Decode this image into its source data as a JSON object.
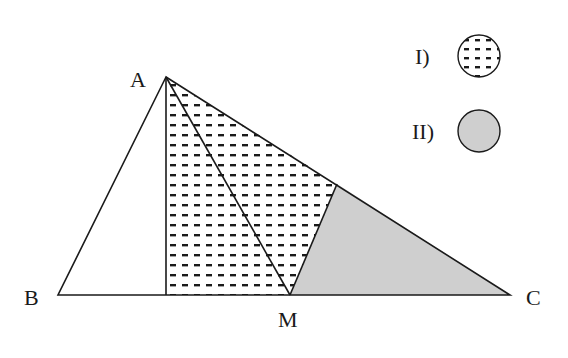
{
  "diagram": {
    "points": {
      "A": {
        "label": "A",
        "x": 166,
        "y": 77
      },
      "B": {
        "label": "B",
        "x": 58,
        "y": 295
      },
      "H": {
        "label": "",
        "x": 166,
        "y": 295
      },
      "M": {
        "label": "M",
        "x": 290,
        "y": 295
      },
      "C": {
        "label": "C",
        "x": 510,
        "y": 295
      },
      "N": {
        "label": "",
        "x": 337,
        "y": 184
      }
    },
    "regions": [
      {
        "id": "I",
        "fill": "dashed-pattern",
        "vertices": [
          "A",
          "H",
          "M",
          "N"
        ]
      },
      {
        "id": "II",
        "fill": "#cfcfcf",
        "vertices": [
          "N",
          "M",
          "C"
        ]
      }
    ],
    "legend": [
      {
        "label": "I)",
        "fill": "dashed-pattern"
      },
      {
        "label": "II)",
        "fill": "#cfcfcf"
      }
    ],
    "colors": {
      "stroke": "#1a1a1a",
      "shade": "#cfcfcf",
      "dash": "#1a1a1a"
    }
  }
}
